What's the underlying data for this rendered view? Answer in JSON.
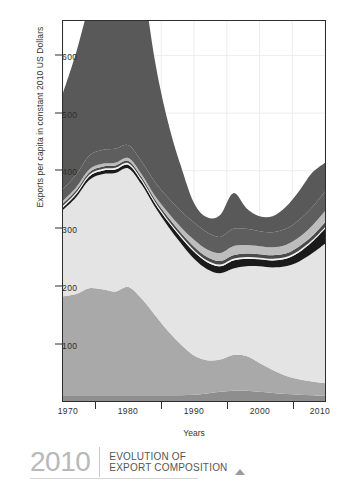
{
  "chart_data": {
    "type": "area",
    "title": "EVOLUTION OF EXPORT COMPOSITION",
    "xlabel": "Years",
    "ylabel": "Exports per capita in constant 2010 US Dollars",
    "xlim": [
      1970,
      2010
    ],
    "ylim": [
      0,
      660
    ],
    "xticks": [
      1970,
      1980,
      1990,
      2000,
      2010
    ],
    "xticks_minor": [
      1975,
      1985,
      1995,
      2005
    ],
    "yticks": [
      100,
      200,
      300,
      400,
      500,
      600
    ],
    "grid": true,
    "legend_position": "none",
    "stacked": true,
    "x": [
      1970,
      1972,
      1974,
      1976,
      1978,
      1980,
      1982,
      1984,
      1986,
      1988,
      1990,
      1992,
      1994,
      1996,
      1998,
      2000,
      2002,
      2004,
      2006,
      2008,
      2010
    ],
    "series": [
      {
        "name": "layer-1-base-dark",
        "color": "#8e8e8e",
        "values": [
          10,
          10,
          10,
          10,
          10,
          10,
          10,
          10,
          10,
          10,
          11,
          13,
          16,
          18,
          18,
          16,
          14,
          12,
          11,
          10,
          9
        ]
      },
      {
        "name": "layer-2-mid-grey",
        "color": "#a9a9a9",
        "values": [
          172,
          176,
          186,
          184,
          180,
          188,
          168,
          140,
          112,
          88,
          68,
          58,
          56,
          62,
          60,
          50,
          40,
          32,
          27,
          24,
          22
        ]
      },
      {
        "name": "layer-3-pale",
        "color": "#e4e4e4",
        "values": [
          150,
          168,
          188,
          200,
          206,
          206,
          198,
          188,
          182,
          176,
          168,
          158,
          150,
          150,
          156,
          168,
          178,
          190,
          204,
          222,
          242
        ]
      },
      {
        "name": "layer-4-black",
        "color": "#1a1a1a",
        "values": [
          4,
          5,
          6,
          6,
          6,
          6,
          6,
          6,
          8,
          10,
          12,
          12,
          12,
          14,
          13,
          12,
          12,
          13,
          16,
          20,
          26
        ]
      },
      {
        "name": "layer-5-white-thin",
        "color": "#f2f2f2",
        "values": [
          3,
          3,
          3,
          3,
          3,
          3,
          3,
          3,
          3,
          3,
          3,
          3,
          3,
          3,
          3,
          3,
          3,
          3,
          3,
          3,
          3
        ]
      },
      {
        "name": "layer-6-dark-thin",
        "color": "#4a4a4a",
        "values": [
          4,
          4,
          4,
          4,
          4,
          4,
          4,
          4,
          5,
          5,
          6,
          6,
          6,
          6,
          6,
          6,
          6,
          6,
          7,
          7,
          8
        ]
      },
      {
        "name": "layer-7-mid-light",
        "color": "#bdbdbd",
        "values": [
          5,
          5,
          5,
          5,
          5,
          5,
          5,
          6,
          8,
          10,
          12,
          13,
          14,
          16,
          15,
          14,
          14,
          15,
          16,
          18,
          20
        ]
      },
      {
        "name": "layer-8-charcoal",
        "color": "#5e5e5e",
        "values": [
          20,
          22,
          24,
          24,
          24,
          22,
          22,
          24,
          26,
          28,
          30,
          30,
          28,
          30,
          28,
          26,
          26,
          28,
          30,
          32,
          34
        ]
      },
      {
        "name": "layer-9-top-dark",
        "color": "#595959",
        "values": [
          167,
          212,
          262,
          320,
          386,
          430,
          330,
          212,
          132,
          78,
          34,
          26,
          38,
          62,
          36,
          26,
          28,
          38,
          50,
          60,
          50
        ]
      }
    ],
    "totals_note": "Stacked total peaks near 660+ around 1980, dips to ~250 around 1992, local peak ~330 around 1996, dips to ~255 around 2000, rises to ~405 by 2010"
  },
  "axes": {
    "y_title": "Exports per capita in constant 2010 US Dollars",
    "x_title": "Years",
    "y_tick_labels": [
      "100",
      "200",
      "300",
      "400",
      "500",
      "600"
    ],
    "x_tick_labels": [
      "1970",
      "1980",
      "1990",
      "2000",
      "2010"
    ]
  },
  "footer": {
    "year": "2010",
    "title_line1": "EVOLUTION OF",
    "title_line2": "EXPORT COMPOSITION",
    "triangle_icon": "triangle-up-icon"
  },
  "colors": {
    "frame": "#2e2e2e",
    "grid": "#e8e8e8",
    "text": "#333333",
    "footer_year": "#b8b8b8",
    "footer_title": "#555555",
    "footer_divider": "#c9c9c9"
  }
}
